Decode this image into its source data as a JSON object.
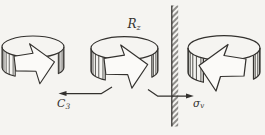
{
  "figure": {
    "type": "symmetry-operation-diagram",
    "colors": {
      "paper": "#f5f4f1",
      "line": "#33312e",
      "arrow-fill": "#fbfaf8"
    },
    "labels": {
      "rotation_main": "R",
      "rotation_sub": "z",
      "c3_main": "C",
      "c3_sub": "3",
      "sigma_main": "σ",
      "sigma_sub": "v"
    }
  }
}
